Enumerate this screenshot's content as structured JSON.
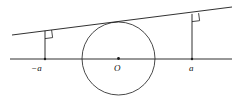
{
  "figure": {
    "kind": "geometry-diagram",
    "width": 241,
    "height": 111,
    "background_color": "#ffffff",
    "stroke_color": "#1a1a1a",
    "stroke_width": 0.8,
    "labels": {
      "left_foot": "−a",
      "center": "O",
      "right_foot": "a"
    },
    "geometry": {
      "axis_line": {
        "x1": 10,
        "y1": 59,
        "x2": 232,
        "y2": 59
      },
      "slant_line": {
        "x1": 12,
        "y1": 35,
        "x2": 232,
        "y2": 7
      },
      "circle": {
        "cx": 118.5,
        "cy": 58.5,
        "r": 36.5
      },
      "center_dot": {
        "cx": 118.5,
        "cy": 58.5,
        "r": 1.4
      },
      "left_perpendicular": {
        "x1": 45,
        "y1": 30.8,
        "x2": 45,
        "y2": 59
      },
      "right_perpendicular": {
        "x1": 192,
        "y1": 13.9,
        "x2": 192,
        "y2": 59
      },
      "left_foot_dot": {
        "cx": 45,
        "cy": 59,
        "r": 1.2
      },
      "right_foot_dot": {
        "cx": 192,
        "cy": 59,
        "r": 1.2
      },
      "left_right_angle_marker": "M 45 38.6 L 52.6 37.6 L 51.6 30.0",
      "right_right_angle_marker": "M 192 21.6 L 199.6 20.7 L 198.6 13.1"
    }
  }
}
